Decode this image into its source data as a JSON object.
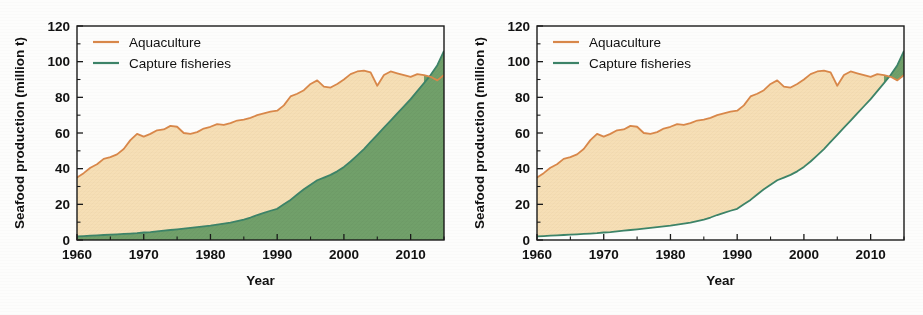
{
  "figure": {
    "panel_count": 2,
    "background": "#fdfdfc"
  },
  "colors": {
    "aquaculture_line": "#d9884a",
    "capture_line": "#3d8468",
    "band_fill": "#f6dfb6",
    "green_fill": "#71a06a",
    "axis": "#1a1a1a",
    "text": "#111111"
  },
  "chart_data": [
    {
      "id": "left-panel",
      "type": "area",
      "title": "",
      "xlabel": "Year",
      "ylabel": "Seafood production (million t)",
      "xlim": [
        1960,
        2015
      ],
      "ylim": [
        0,
        120
      ],
      "yticks": [
        0,
        20,
        40,
        60,
        80,
        100,
        120
      ],
      "xticks": [
        1960,
        1970,
        1980,
        1990,
        2000,
        2010
      ],
      "xminorticks": [
        1965,
        1975,
        1985,
        1995,
        2005,
        2015
      ],
      "grid": false,
      "legend_position": "top-left",
      "fill_style": "green filled to baseline; tan band between capture and aquaculture curves",
      "legend": [
        "Aquaculture",
        "Capture fisheries"
      ],
      "x": [
        1960,
        1961,
        1962,
        1963,
        1964,
        1965,
        1966,
        1967,
        1968,
        1969,
        1970,
        1971,
        1972,
        1973,
        1974,
        1975,
        1976,
        1977,
        1978,
        1979,
        1980,
        1981,
        1982,
        1983,
        1984,
        1985,
        1986,
        1987,
        1988,
        1989,
        1990,
        1991,
        1992,
        1993,
        1994,
        1995,
        1996,
        1997,
        1998,
        1999,
        2000,
        2001,
        2002,
        2003,
        2004,
        2005,
        2006,
        2007,
        2008,
        2009,
        2010,
        2011,
        2012,
        2013,
        2014,
        2015
      ],
      "series": [
        {
          "name": "Aquaculture",
          "legend_label": "Aquaculture",
          "color": "#d9884a",
          "values": [
            35.0,
            37.5,
            40.5,
            42.5,
            45.5,
            46.5,
            48.0,
            51.0,
            56.0,
            59.5,
            58.0,
            59.5,
            61.5,
            62.0,
            64.0,
            63.5,
            60.0,
            59.5,
            60.5,
            62.5,
            63.5,
            65.0,
            64.5,
            65.5,
            67.0,
            67.5,
            68.5,
            70.0,
            71.0,
            72.0,
            72.5,
            75.5,
            80.5,
            82.0,
            84.0,
            87.5,
            89.5,
            86.0,
            85.5,
            87.5,
            90.0,
            93.0,
            94.5,
            95.0,
            94.0,
            86.5,
            92.5,
            94.5,
            93.5,
            92.5,
            91.5,
            93.0,
            92.5,
            91.5,
            89.5,
            92.5
          ]
        },
        {
          "name": "Capture fisheries",
          "legend_label": "Capture fisheries",
          "color": "#3d8468",
          "values": [
            2.0,
            2.2,
            2.4,
            2.6,
            2.8,
            3.0,
            3.2,
            3.4,
            3.6,
            3.8,
            4.2,
            4.4,
            4.8,
            5.2,
            5.6,
            6.0,
            6.4,
            6.8,
            7.2,
            7.6,
            8.0,
            8.6,
            9.2,
            9.8,
            10.6,
            11.4,
            12.6,
            14.0,
            15.2,
            16.4,
            17.5,
            20.0,
            22.5,
            25.5,
            28.5,
            31.0,
            33.5,
            35.0,
            36.5,
            38.5,
            41.0,
            44.0,
            47.5,
            51.0,
            55.0,
            59.0,
            63.0,
            67.0,
            71.0,
            75.0,
            79.0,
            83.5,
            88.0,
            92.5,
            98.0,
            106.0
          ]
        }
      ]
    },
    {
      "id": "right-panel",
      "type": "area",
      "title": "",
      "xlabel": "Year",
      "ylabel": "Seafood production (million t)",
      "xlim": [
        1960,
        2015
      ],
      "ylim": [
        0,
        120
      ],
      "yticks": [
        0,
        20,
        40,
        60,
        80,
        100,
        120
      ],
      "xticks": [
        1960,
        1970,
        1980,
        1990,
        2000,
        2010
      ],
      "xminorticks": [
        1965,
        1975,
        1985,
        1995,
        2005,
        2015
      ],
      "grid": false,
      "legend_position": "top-left",
      "fill_style": "tan band between curves only; white below green; green where green exceeds orange",
      "legend": [
        "Aquaculture",
        "Capture fisheries"
      ],
      "x": [
        1960,
        1961,
        1962,
        1963,
        1964,
        1965,
        1966,
        1967,
        1968,
        1969,
        1970,
        1971,
        1972,
        1973,
        1974,
        1975,
        1976,
        1977,
        1978,
        1979,
        1980,
        1981,
        1982,
        1983,
        1984,
        1985,
        1986,
        1987,
        1988,
        1989,
        1990,
        1991,
        1992,
        1993,
        1994,
        1995,
        1996,
        1997,
        1998,
        1999,
        2000,
        2001,
        2002,
        2003,
        2004,
        2005,
        2006,
        2007,
        2008,
        2009,
        2010,
        2011,
        2012,
        2013,
        2014,
        2015
      ],
      "series": [
        {
          "name": "Aquaculture",
          "legend_label": "Aquaculture",
          "color": "#d9884a",
          "values": [
            35.0,
            37.5,
            40.5,
            42.5,
            45.5,
            46.5,
            48.0,
            51.0,
            56.0,
            59.5,
            58.0,
            59.5,
            61.5,
            62.0,
            64.0,
            63.5,
            60.0,
            59.5,
            60.5,
            62.5,
            63.5,
            65.0,
            64.5,
            65.5,
            67.0,
            67.5,
            68.5,
            70.0,
            71.0,
            72.0,
            72.5,
            75.5,
            80.5,
            82.0,
            84.0,
            87.5,
            89.5,
            86.0,
            85.5,
            87.5,
            90.0,
            93.0,
            94.5,
            95.0,
            94.0,
            86.5,
            92.5,
            94.5,
            93.5,
            92.5,
            91.5,
            93.0,
            92.5,
            91.5,
            89.5,
            92.5
          ]
        },
        {
          "name": "Capture fisheries",
          "legend_label": "Capture fisheries",
          "color": "#3d8468",
          "values": [
            2.0,
            2.2,
            2.4,
            2.6,
            2.8,
            3.0,
            3.2,
            3.4,
            3.6,
            3.8,
            4.2,
            4.4,
            4.8,
            5.2,
            5.6,
            6.0,
            6.4,
            6.8,
            7.2,
            7.6,
            8.0,
            8.6,
            9.2,
            9.8,
            10.6,
            11.4,
            12.6,
            14.0,
            15.2,
            16.4,
            17.5,
            20.0,
            22.5,
            25.5,
            28.5,
            31.0,
            33.5,
            35.0,
            36.5,
            38.5,
            41.0,
            44.0,
            47.5,
            51.0,
            55.0,
            59.0,
            63.0,
            67.0,
            71.0,
            75.0,
            79.0,
            83.5,
            88.0,
            92.5,
            98.0,
            106.0
          ]
        }
      ]
    }
  ]
}
